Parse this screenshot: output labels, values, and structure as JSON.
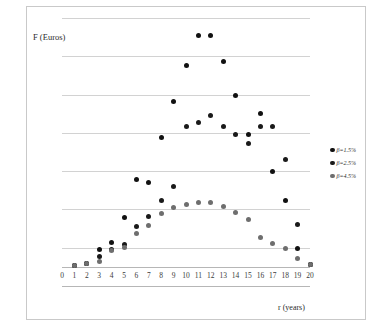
{
  "chart_data": {
    "type": "scatter",
    "title": "",
    "xlabel": "r (years)",
    "ylabel": "F (Euros)",
    "xlim": [
      0,
      20
    ],
    "ylim": [
      -1,
      13
    ],
    "xticks": [
      0,
      1,
      2,
      3,
      4,
      5,
      6,
      7,
      8,
      9,
      10,
      11,
      12,
      13,
      14,
      15,
      16,
      17,
      18,
      19,
      20
    ],
    "yticks": [
      -1,
      1,
      3,
      5,
      7,
      9,
      11,
      13
    ],
    "grid": true,
    "legend_position": "right",
    "x": [
      1,
      2,
      3,
      4,
      5,
      6,
      7,
      8,
      9,
      10,
      11,
      12,
      13,
      14,
      15,
      16,
      17,
      18,
      19,
      20
    ],
    "series": [
      {
        "name": "β=1.5%",
        "color": "#111111",
        "values": [
          0.05,
          0.15,
          0.9,
          1.25,
          2.6,
          4.55,
          4.4,
          6.75,
          8.65,
          10.5,
          12.1,
          12.1,
          10.75,
          8.95,
          6.9,
          8.0,
          5.0,
          3.45,
          0.95,
          0.1
        ]
      },
      {
        "name": "β=2.5%",
        "color": "#1a1a1a",
        "values": [
          0.05,
          0.2,
          0.55,
          0.9,
          1.15,
          2.1,
          2.65,
          3.45,
          4.2,
          7.35,
          7.55,
          7.9,
          7.35,
          6.9,
          6.45,
          7.35,
          7.35,
          5.6,
          2.2,
          0.1
        ]
      },
      {
        "name": "β=4.5%",
        "color": "#6e6e6e",
        "values": [
          0.05,
          0.2,
          0.3,
          0.85,
          1.0,
          1.75,
          2.15,
          2.8,
          3.1,
          3.25,
          3.35,
          3.35,
          3.15,
          2.85,
          2.5,
          1.55,
          1.2,
          0.95,
          0.45,
          0.1
        ]
      }
    ]
  },
  "legend": {
    "items": [
      {
        "label": "β=1.5%",
        "color": "#111111"
      },
      {
        "label": "β=2.5%",
        "color": "#1a1a1a"
      },
      {
        "label": "β=4.5%",
        "color": "#6e6e6e"
      }
    ]
  }
}
